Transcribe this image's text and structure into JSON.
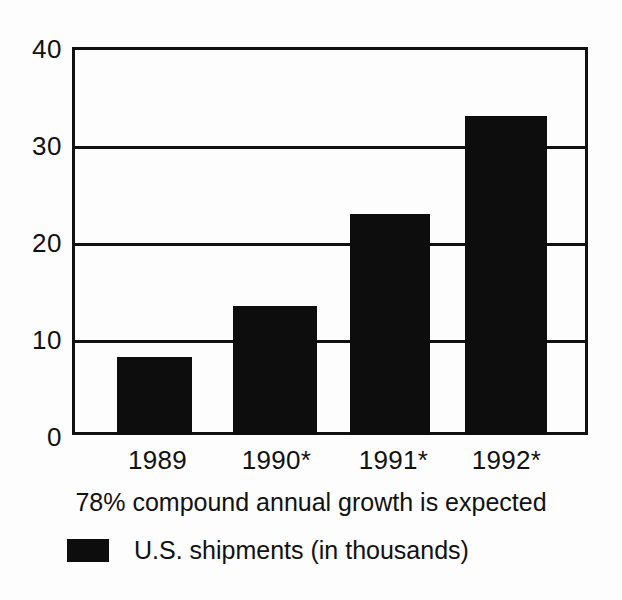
{
  "chart_data": {
    "type": "bar",
    "title": "",
    "subtitle": "",
    "categories": [
      "1989",
      "1990*",
      "1991*",
      "1992*"
    ],
    "values": [
      8,
      13.3,
      22.8,
      32.9
    ],
    "series": [
      {
        "name": "U.S. shipments (in thousands)",
        "values": [
          8,
          13.3,
          22.8,
          32.9
        ],
        "color": "#0d0d0d"
      }
    ],
    "xlabel": "",
    "ylabel": "",
    "ylim": [
      0,
      40
    ],
    "yticks": [
      40,
      30,
      20,
      10,
      0
    ],
    "ytick_labels": [
      "40",
      "30",
      "20",
      "10",
      "0"
    ],
    "grid": true,
    "grid_axis": "y",
    "legend_position": "bottom-left",
    "annotation": "78% compound annual growth is expected",
    "footnote_marker": "*",
    "bar_color": "#0d0d0d",
    "axis_color": "#111111",
    "background": "#fdfdfd"
  },
  "axes": {
    "y": {
      "ticks": [
        {
          "label": "40",
          "value": 40
        },
        {
          "label": "30",
          "value": 30
        },
        {
          "label": "20",
          "value": 20
        },
        {
          "label": "10",
          "value": 10
        },
        {
          "label": "0",
          "value": 0
        }
      ]
    },
    "x": {
      "ticks": [
        {
          "label": "1989"
        },
        {
          "label": "1990*"
        },
        {
          "label": "1991*"
        },
        {
          "label": "1992*"
        }
      ]
    }
  },
  "annotation": {
    "text": "78% compound annual growth is expected"
  },
  "legend": {
    "items": [
      {
        "label": "U.S. shipments (in thousands)",
        "color": "#0d0d0d"
      }
    ]
  }
}
